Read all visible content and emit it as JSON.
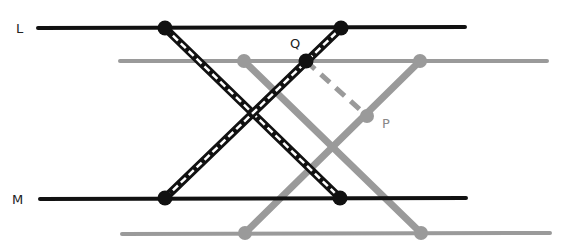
{
  "diagram": {
    "colors": {
      "black": "#111111",
      "gray": "#9a9a9a",
      "white": "#ffffff"
    },
    "labels": {
      "L": "L",
      "M": "M",
      "Q": "Q",
      "P": "P"
    },
    "black_lines": {
      "L": {
        "x1": 38,
        "y1": 28,
        "x2": 465,
        "y2": 27
      },
      "M": {
        "x1": 40,
        "y1": 199,
        "x2": 466,
        "y2": 198
      }
    },
    "gray_lines": {
      "top": {
        "x1": 120,
        "y1": 61,
        "x2": 547,
        "y2": 61
      },
      "bottom": {
        "x1": 122,
        "y1": 234,
        "x2": 550,
        "y2": 233
      }
    },
    "black_points": [
      {
        "name": "L-left",
        "x": 165,
        "y": 28
      },
      {
        "name": "L-right",
        "x": 341,
        "y": 28
      },
      {
        "name": "M-left",
        "x": 165,
        "y": 198
      },
      {
        "name": "M-right",
        "x": 340,
        "y": 198
      },
      {
        "name": "Q",
        "x": 306,
        "y": 61
      }
    ],
    "gray_points": [
      {
        "name": "top-left",
        "x": 244,
        "y": 61
      },
      {
        "name": "top-right",
        "x": 420,
        "y": 61
      },
      {
        "name": "bottom-left",
        "x": 245,
        "y": 233
      },
      {
        "name": "bottom-right",
        "x": 421,
        "y": 233
      },
      {
        "name": "P",
        "x": 367,
        "y": 116
      }
    ]
  }
}
